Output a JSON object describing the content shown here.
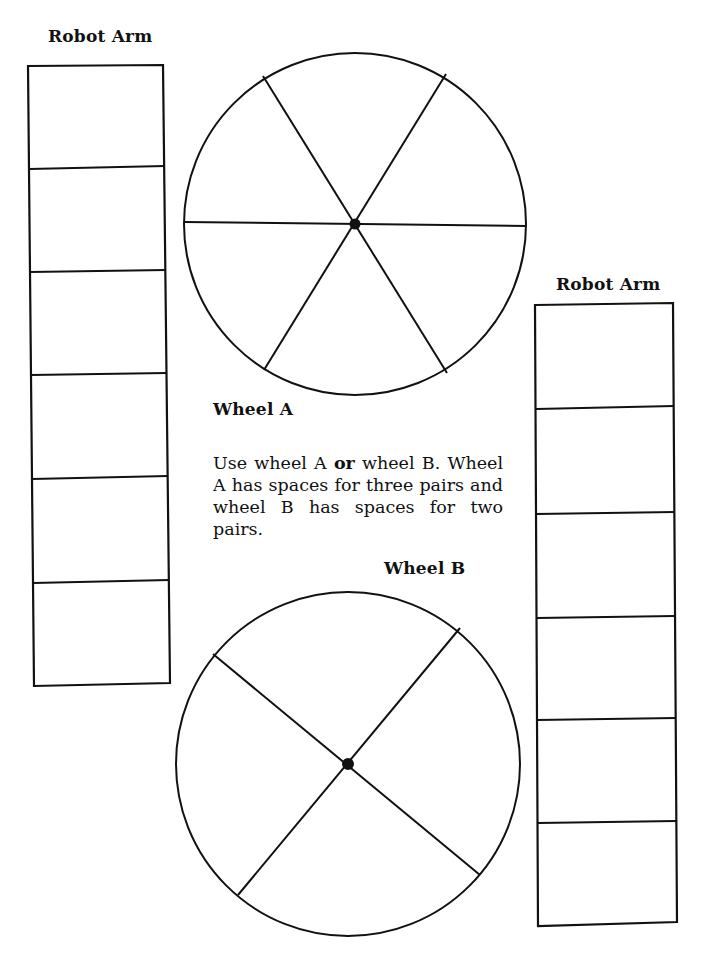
{
  "labels": {
    "robot_arm_left": "Robot Arm",
    "robot_arm_right": "Robot Arm",
    "wheel_a": "Wheel A",
    "wheel_b": "Wheel B"
  },
  "instructions": {
    "part1": "Use wheel A ",
    "emphasis": "or",
    "part2": " wheel B. Wheel A has spaces for three pairs and wheel B has spaces for two pairs."
  },
  "robot_arm_left": {
    "cells": 6
  },
  "robot_arm_right": {
    "cells": 6
  },
  "wheel_a": {
    "sections": 6
  },
  "wheel_b": {
    "sections": 4
  },
  "colors": {
    "ink": "#111111",
    "paper": "#ffffff"
  }
}
